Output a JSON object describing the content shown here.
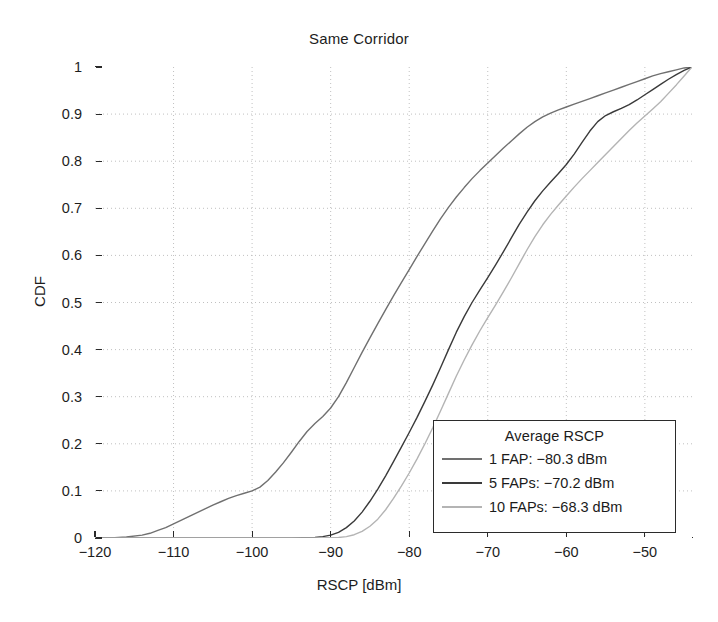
{
  "chart_data": {
    "type": "line",
    "title": "Same Corridor",
    "xlabel": "RSCP [dBm]",
    "ylabel": "CDF",
    "xlim": [
      -120,
      -44
    ],
    "ylim": [
      0,
      1
    ],
    "grid": true,
    "legend_position": "lower-right",
    "legend_title": "Average RSCP",
    "xticks": [
      -120,
      -110,
      -100,
      -90,
      -80,
      -70,
      -60,
      -50
    ],
    "xtick_labels": [
      "−120",
      "−110",
      "−100",
      "−90",
      "−80",
      "−70",
      "−60",
      "−50"
    ],
    "yticks": [
      0,
      0.1,
      0.2,
      0.3,
      0.4,
      0.5,
      0.6,
      0.7,
      0.8,
      0.9,
      1
    ],
    "ytick_labels": [
      "0",
      "0.1",
      "0.2",
      "0.3",
      "0.4",
      "0.5",
      "0.6",
      "0.7",
      "0.8",
      "0.9",
      "1"
    ],
    "series": [
      {
        "name": "1 FAP",
        "legend_label": "1 FAP: −80.3 dBm",
        "average_rscp_dbm": -80.3,
        "color": "#707070",
        "x": [
          -120,
          -118,
          -116,
          -114,
          -113,
          -112,
          -111,
          -110,
          -109,
          -108,
          -107,
          -106,
          -105,
          -104,
          -103,
          -102,
          -101,
          -100,
          -99,
          -98,
          -97,
          -96,
          -95,
          -94,
          -93,
          -92,
          -91,
          -90,
          -89,
          -88,
          -87,
          -86,
          -85,
          -84,
          -83,
          -82,
          -81,
          -80,
          -79,
          -78,
          -77,
          -76,
          -75,
          -74,
          -73,
          -72,
          -71,
          -70,
          -69,
          -68,
          -67,
          -66,
          -65,
          -64,
          -63,
          -62,
          -61,
          -60,
          -59,
          -58,
          -57,
          -56,
          -55,
          -54,
          -53,
          -52,
          -51,
          -50,
          -49,
          -48,
          -47,
          -46,
          -45,
          -44
        ],
        "y": [
          0,
          0,
          0.002,
          0.006,
          0.01,
          0.016,
          0.022,
          0.03,
          0.038,
          0.046,
          0.054,
          0.062,
          0.07,
          0.077,
          0.084,
          0.09,
          0.095,
          0.1,
          0.108,
          0.122,
          0.14,
          0.16,
          0.182,
          0.205,
          0.226,
          0.243,
          0.258,
          0.276,
          0.3,
          0.33,
          0.362,
          0.394,
          0.425,
          0.455,
          0.485,
          0.514,
          0.542,
          0.57,
          0.598,
          0.625,
          0.652,
          0.678,
          0.702,
          0.724,
          0.744,
          0.763,
          0.78,
          0.796,
          0.812,
          0.828,
          0.843,
          0.858,
          0.872,
          0.884,
          0.894,
          0.902,
          0.909,
          0.915,
          0.921,
          0.927,
          0.933,
          0.939,
          0.945,
          0.951,
          0.957,
          0.963,
          0.969,
          0.975,
          0.981,
          0.986,
          0.99,
          0.994,
          0.998,
          1.0
        ]
      },
      {
        "name": "5 FAPs",
        "legend_label": "5 FAPs: −70.2 dBm",
        "average_rscp_dbm": -70.2,
        "color": "#3a3a3a",
        "x": [
          -120,
          -100,
          -95,
          -92,
          -91,
          -90,
          -89,
          -88,
          -87,
          -86,
          -85,
          -84,
          -83,
          -82,
          -81,
          -80,
          -79,
          -78,
          -77,
          -76,
          -75,
          -74,
          -73,
          -72,
          -71,
          -70,
          -69,
          -68,
          -67,
          -66,
          -65,
          -64,
          -63,
          -62,
          -61,
          -60,
          -59,
          -58,
          -57,
          -56,
          -55,
          -54,
          -53,
          -52,
          -51,
          -50,
          -49,
          -48,
          -47,
          -46,
          -45,
          -44
        ],
        "y": [
          0,
          0,
          0,
          0.001,
          0.003,
          0.006,
          0.012,
          0.022,
          0.036,
          0.055,
          0.078,
          0.104,
          0.132,
          0.162,
          0.193,
          0.224,
          0.256,
          0.29,
          0.325,
          0.362,
          0.4,
          0.437,
          0.47,
          0.5,
          0.527,
          0.553,
          0.58,
          0.608,
          0.637,
          0.666,
          0.692,
          0.716,
          0.737,
          0.756,
          0.774,
          0.793,
          0.815,
          0.84,
          0.864,
          0.884,
          0.897,
          0.905,
          0.912,
          0.92,
          0.93,
          0.941,
          0.952,
          0.963,
          0.974,
          0.984,
          0.993,
          1.0
        ]
      },
      {
        "name": "10 FAPs",
        "legend_label": "10 FAPs: −68.3 dBm",
        "average_rscp_dbm": -68.3,
        "color": "#b4b4b4",
        "x": [
          -120,
          -100,
          -92,
          -89,
          -88,
          -87,
          -86,
          -85,
          -84,
          -83,
          -82,
          -81,
          -80,
          -79,
          -78,
          -77,
          -76,
          -75,
          -74,
          -73,
          -72,
          -71,
          -70,
          -69,
          -68,
          -67,
          -66,
          -65,
          -64,
          -63,
          -62,
          -61,
          -60,
          -59,
          -58,
          -57,
          -56,
          -55,
          -54,
          -53,
          -52,
          -51,
          -50,
          -49,
          -48,
          -47,
          -46,
          -45,
          -44
        ],
        "y": [
          0,
          0,
          0,
          0.001,
          0.003,
          0.007,
          0.014,
          0.025,
          0.04,
          0.06,
          0.084,
          0.11,
          0.138,
          0.168,
          0.2,
          0.234,
          0.27,
          0.307,
          0.344,
          0.378,
          0.41,
          0.44,
          0.468,
          0.495,
          0.523,
          0.552,
          0.582,
          0.612,
          0.64,
          0.665,
          0.687,
          0.707,
          0.726,
          0.745,
          0.763,
          0.78,
          0.797,
          0.814,
          0.831,
          0.848,
          0.865,
          0.881,
          0.896,
          0.911,
          0.926,
          0.944,
          0.962,
          0.981,
          1.0
        ]
      }
    ]
  },
  "figure": {
    "title": "Same Corridor",
    "xlabel": "RSCP [dBm]",
    "ylabel": "CDF",
    "legend_title": "Average RSCP"
  }
}
